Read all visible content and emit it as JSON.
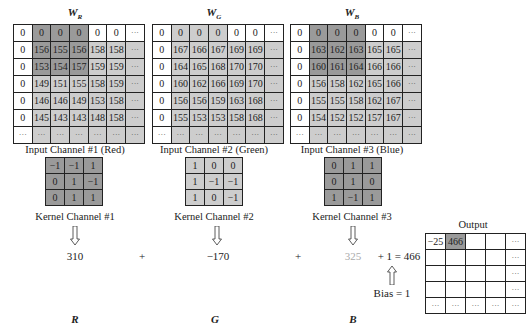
{
  "inputs": [
    {
      "title": "W",
      "subscript": "R",
      "caption": "Input Channel #1 (Red)",
      "rows": [
        [
          "0",
          "0",
          "0",
          "0",
          "0",
          "0",
          "···"
        ],
        [
          "0",
          "156",
          "155",
          "156",
          "158",
          "158",
          "···"
        ],
        [
          "0",
          "153",
          "154",
          "157",
          "159",
          "159",
          "···"
        ],
        [
          "0",
          "149",
          "151",
          "155",
          "158",
          "159",
          "···"
        ],
        [
          "0",
          "146",
          "146",
          "149",
          "153",
          "158",
          "···"
        ],
        [
          "0",
          "145",
          "143",
          "143",
          "148",
          "158",
          "···"
        ],
        [
          "···",
          "···",
          "···",
          "···",
          "···",
          "···",
          "···"
        ]
      ],
      "shade": [
        [
          "w",
          "d",
          "d",
          "d",
          "w",
          "w",
          "w"
        ],
        [
          "w",
          "d",
          "d",
          "d",
          "l",
          "l",
          "l"
        ],
        [
          "w",
          "d",
          "d",
          "d",
          "l",
          "l",
          "l"
        ],
        [
          "w",
          "l",
          "l",
          "l",
          "l",
          "l",
          "l"
        ],
        [
          "w",
          "l",
          "l",
          "l",
          "l",
          "l",
          "l"
        ],
        [
          "w",
          "l",
          "l",
          "l",
          "l",
          "l",
          "l"
        ],
        [
          "w",
          "l",
          "l",
          "l",
          "l",
          "l",
          "l"
        ]
      ]
    },
    {
      "title": "W",
      "subscript": "G",
      "caption": "Input Channel #2 (Green)",
      "rows": [
        [
          "0",
          "0",
          "0",
          "0",
          "0",
          "0",
          "···"
        ],
        [
          "0",
          "167",
          "166",
          "167",
          "169",
          "169",
          "···"
        ],
        [
          "0",
          "164",
          "165",
          "168",
          "170",
          "170",
          "···"
        ],
        [
          "0",
          "160",
          "162",
          "166",
          "169",
          "170",
          "···"
        ],
        [
          "0",
          "156",
          "156",
          "159",
          "163",
          "168",
          "···"
        ],
        [
          "0",
          "155",
          "153",
          "153",
          "158",
          "168",
          "···"
        ],
        [
          "···",
          "···",
          "···",
          "···",
          "···",
          "···",
          "···"
        ]
      ],
      "shade": [
        [
          "w",
          "l",
          "l",
          "l",
          "w",
          "w",
          "w"
        ],
        [
          "w",
          "l",
          "l",
          "l",
          "l",
          "l",
          "l"
        ],
        [
          "w",
          "l",
          "l",
          "l",
          "l",
          "l",
          "l"
        ],
        [
          "w",
          "l",
          "l",
          "l",
          "l",
          "l",
          "l"
        ],
        [
          "w",
          "l",
          "l",
          "l",
          "l",
          "l",
          "l"
        ],
        [
          "w",
          "l",
          "l",
          "l",
          "l",
          "l",
          "l"
        ],
        [
          "w",
          "l",
          "l",
          "l",
          "l",
          "l",
          "l"
        ]
      ]
    },
    {
      "title": "W",
      "subscript": "B",
      "caption": "Input Channel #3 (Blue)",
      "rows": [
        [
          "0",
          "0",
          "0",
          "0",
          "0",
          "0",
          "···"
        ],
        [
          "0",
          "163",
          "162",
          "163",
          "165",
          "165",
          "···"
        ],
        [
          "0",
          "160",
          "161",
          "164",
          "166",
          "166",
          "···"
        ],
        [
          "0",
          "156",
          "158",
          "162",
          "165",
          "166",
          "···"
        ],
        [
          "0",
          "155",
          "155",
          "158",
          "162",
          "167",
          "···"
        ],
        [
          "0",
          "154",
          "152",
          "152",
          "157",
          "167",
          "···"
        ],
        [
          "···",
          "···",
          "···",
          "···",
          "···",
          "···",
          "···"
        ]
      ],
      "shade": [
        [
          "w",
          "d",
          "d",
          "d",
          "w",
          "w",
          "w"
        ],
        [
          "w",
          "d",
          "d",
          "d",
          "l",
          "l",
          "l"
        ],
        [
          "w",
          "d",
          "d",
          "d",
          "l",
          "l",
          "l"
        ],
        [
          "w",
          "l",
          "l",
          "l",
          "l",
          "l",
          "l"
        ],
        [
          "w",
          "l",
          "l",
          "l",
          "l",
          "l",
          "l"
        ],
        [
          "w",
          "l",
          "l",
          "l",
          "l",
          "l",
          "l"
        ],
        [
          "w",
          "l",
          "l",
          "l",
          "l",
          "l",
          "l"
        ]
      ]
    }
  ],
  "kernels": [
    {
      "caption": "Kernel Channel #1",
      "shade": "d",
      "rows": [
        [
          "-1",
          "-1",
          "1"
        ],
        [
          "0",
          "1",
          "-1"
        ],
        [
          "0",
          "1",
          "1"
        ]
      ]
    },
    {
      "caption": "Kernel Channel #2",
      "shade": "l",
      "rows": [
        [
          "1",
          "0",
          "0"
        ],
        [
          "1",
          "-1",
          "-1"
        ],
        [
          "1",
          "0",
          "-1"
        ]
      ]
    },
    {
      "caption": "Kernel Channel #3",
      "shade": "d",
      "rows": [
        [
          "0",
          "1",
          "1"
        ],
        [
          "0",
          "1",
          "0"
        ],
        [
          "1",
          "-1",
          "1"
        ]
      ]
    }
  ],
  "results": {
    "r": "310",
    "g": "−170",
    "b": "325",
    "plus1": "+",
    "plus2": "+",
    "sum": "+ 1 = 466",
    "bias": "Bias = 1"
  },
  "labels": {
    "r": "R",
    "g": "G",
    "b": "B"
  },
  "output": {
    "title": "Output",
    "rows": [
      [
        "−25",
        "466",
        "",
        "",
        "···"
      ],
      [
        "",
        "",
        "",
        "",
        "···"
      ],
      [
        "",
        "",
        "",
        "",
        "···"
      ],
      [
        "",
        "",
        "",
        "",
        "···"
      ],
      [
        "···",
        "···",
        "···",
        "···",
        "···"
      ]
    ],
    "shade": [
      [
        "w",
        "d",
        "w",
        "w",
        "w"
      ],
      [
        "w",
        "w",
        "w",
        "w",
        "w"
      ],
      [
        "w",
        "w",
        "w",
        "w",
        "w"
      ],
      [
        "w",
        "w",
        "w",
        "w",
        "w"
      ],
      [
        "w",
        "w",
        "w",
        "w",
        "w"
      ]
    ]
  }
}
